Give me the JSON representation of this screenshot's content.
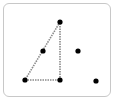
{
  "card": {
    "border_color": "#c8c8c8",
    "background": "#ffffff"
  },
  "figure": {
    "line_color": "#8a8a8a",
    "dot_color": "#000000",
    "triangle": {
      "vertices": [
        {
          "name": "top",
          "x": 60,
          "y": 22
        },
        {
          "name": "bottom-left",
          "x": 25,
          "y": 80
        },
        {
          "name": "bottom-right",
          "x": 60,
          "y": 80
        }
      ],
      "hypotenuse_midpoint": {
        "x": 43,
        "y": 51
      }
    },
    "free_dots": [
      {
        "x": 78,
        "y": 51
      },
      {
        "x": 96,
        "y": 81
      }
    ]
  }
}
